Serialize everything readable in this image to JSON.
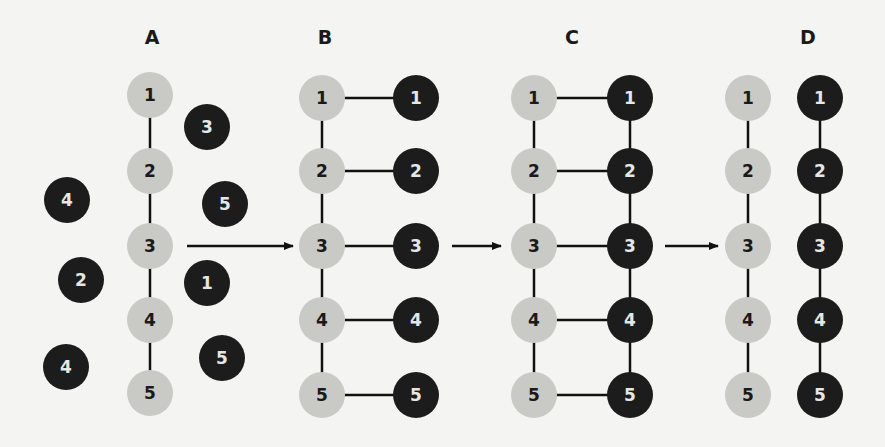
{
  "colors": {
    "background": "#f4f4f2",
    "light_circle": "#c9c9c5",
    "dark_circle": "#1c1c1c",
    "line": "#111111"
  },
  "panels": [
    {
      "label": "A",
      "label_pos": [
        152,
        37
      ],
      "light": [
        {
          "n": "1",
          "x": 150,
          "y": 95
        },
        {
          "n": "2",
          "x": 150,
          "y": 171
        },
        {
          "n": "3",
          "x": 150,
          "y": 246
        },
        {
          "n": "4",
          "x": 150,
          "y": 320
        },
        {
          "n": "5",
          "x": 150,
          "y": 393
        }
      ],
      "dark": [
        {
          "n": "3",
          "x": 207,
          "y": 127
        },
        {
          "n": "4",
          "x": 67,
          "y": 200
        },
        {
          "n": "5",
          "x": 225,
          "y": 204
        },
        {
          "n": "2",
          "x": 81,
          "y": 280
        },
        {
          "n": "1",
          "x": 207,
          "y": 283
        },
        {
          "n": "4",
          "x": 66,
          "y": 367
        },
        {
          "n": "5",
          "x": 222,
          "y": 358
        }
      ],
      "light_chain": true,
      "dark_chain": false,
      "pairs": false
    },
    {
      "label": "B",
      "label_pos": [
        325,
        37
      ],
      "light": [
        {
          "n": "1",
          "x": 322,
          "y": 98
        },
        {
          "n": "2",
          "x": 322,
          "y": 171
        },
        {
          "n": "3",
          "x": 322,
          "y": 246
        },
        {
          "n": "4",
          "x": 322,
          "y": 320
        },
        {
          "n": "5",
          "x": 322,
          "y": 395
        }
      ],
      "dark": [
        {
          "n": "1",
          "x": 416,
          "y": 98
        },
        {
          "n": "2",
          "x": 416,
          "y": 171
        },
        {
          "n": "3",
          "x": 416,
          "y": 246
        },
        {
          "n": "4",
          "x": 416,
          "y": 320
        },
        {
          "n": "5",
          "x": 416,
          "y": 395
        }
      ],
      "light_chain": true,
      "dark_chain": false,
      "pairs": true
    },
    {
      "label": "C",
      "label_pos": [
        572,
        37
      ],
      "light": [
        {
          "n": "1",
          "x": 534,
          "y": 98
        },
        {
          "n": "2",
          "x": 534,
          "y": 171
        },
        {
          "n": "3",
          "x": 534,
          "y": 246
        },
        {
          "n": "4",
          "x": 534,
          "y": 320
        },
        {
          "n": "5",
          "x": 534,
          "y": 395
        }
      ],
      "dark": [
        {
          "n": "1",
          "x": 630,
          "y": 98
        },
        {
          "n": "2",
          "x": 630,
          "y": 171
        },
        {
          "n": "3",
          "x": 630,
          "y": 246
        },
        {
          "n": "4",
          "x": 630,
          "y": 320
        },
        {
          "n": "5",
          "x": 630,
          "y": 395
        }
      ],
      "light_chain": true,
      "dark_chain": true,
      "pairs": true
    },
    {
      "label": "D",
      "label_pos": [
        808,
        37
      ],
      "light": [
        {
          "n": "1",
          "x": 748,
          "y": 98
        },
        {
          "n": "2",
          "x": 748,
          "y": 171
        },
        {
          "n": "3",
          "x": 748,
          "y": 246
        },
        {
          "n": "4",
          "x": 748,
          "y": 320
        },
        {
          "n": "5",
          "x": 748,
          "y": 395
        }
      ],
      "dark": [
        {
          "n": "1",
          "x": 820,
          "y": 98
        },
        {
          "n": "2",
          "x": 820,
          "y": 171
        },
        {
          "n": "3",
          "x": 820,
          "y": 246
        },
        {
          "n": "4",
          "x": 820,
          "y": 320
        },
        {
          "n": "5",
          "x": 820,
          "y": 395
        }
      ],
      "light_chain": true,
      "dark_chain": true,
      "pairs": false
    }
  ],
  "arrows": [
    {
      "from": "A",
      "to": "B",
      "x1": 187,
      "x2": 293,
      "y": 246
    },
    {
      "from": "B",
      "to": "C",
      "x1": 452,
      "x2": 501,
      "y": 246
    },
    {
      "from": "C",
      "to": "D",
      "x1": 665,
      "x2": 718,
      "y": 246
    }
  ]
}
